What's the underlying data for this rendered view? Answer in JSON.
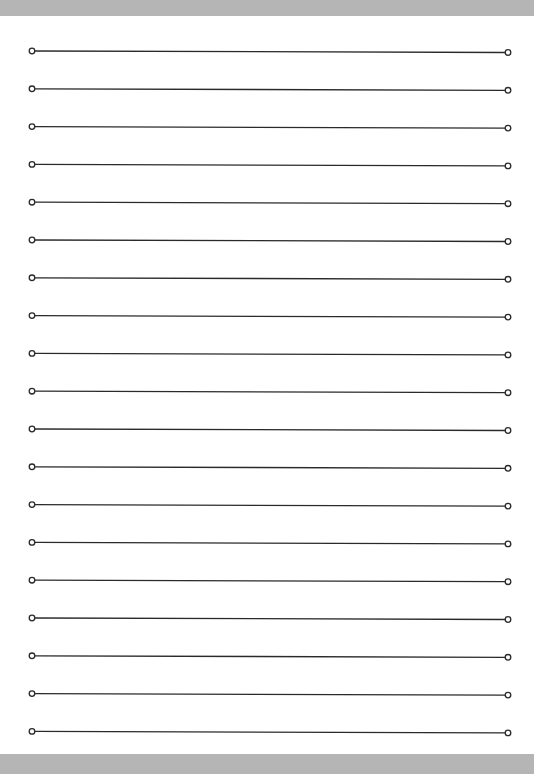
{
  "page": {
    "type": "lined-paper",
    "line_count": 19,
    "first_line_y": 51,
    "line_spacing": 37.8,
    "line_start_x": 32,
    "line_end_x": 508,
    "end_offset_y": 1.5,
    "line_color": "#2a2a2a",
    "frame_color": "#b5b5b5"
  }
}
